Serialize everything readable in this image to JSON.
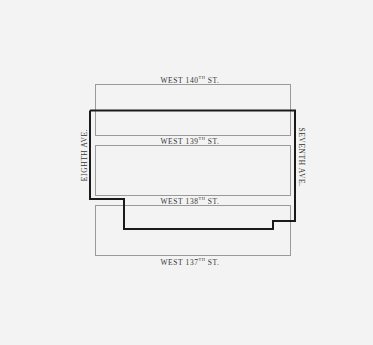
{
  "diagram": {
    "type": "street-block-map",
    "streets": {
      "top": {
        "name": "WEST 140",
        "suffix": "TH",
        "type": "ST."
      },
      "upper_middle": {
        "name": "WEST 139",
        "suffix": "TH",
        "type": "ST."
      },
      "lower_middle": {
        "name": "WEST 138",
        "suffix": "TH",
        "type": "ST."
      },
      "bottom": {
        "name": "WEST 137",
        "suffix": "TH",
        "type": "ST."
      }
    },
    "avenues": {
      "left": "EIGHTH AVE.",
      "right": "SEVENTH AVE."
    },
    "boundary_color": "#1a1a1a",
    "block_color": "#9a9a9a",
    "background": "#f3f3f3"
  }
}
